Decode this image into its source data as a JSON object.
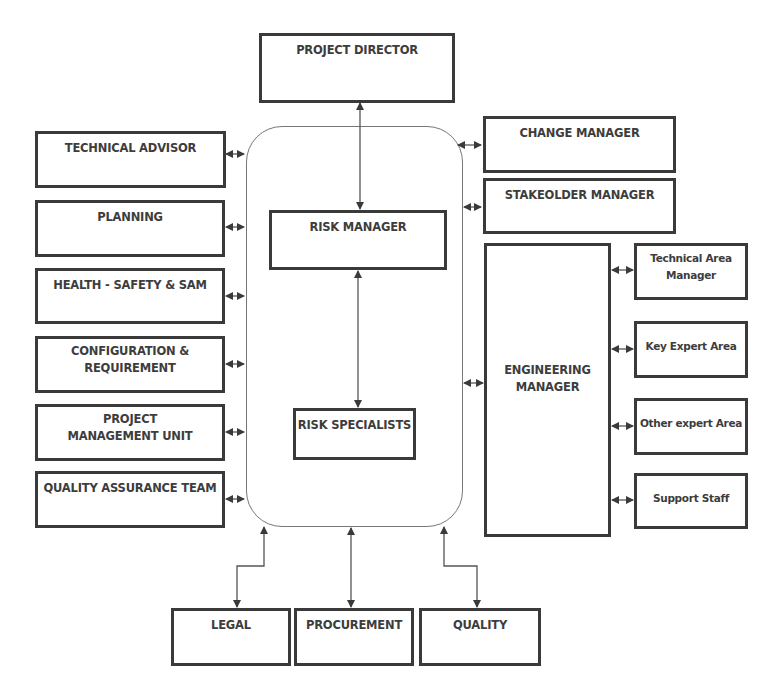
{
  "diagram": {
    "top": {
      "project_director": "PROJECT DIRECTOR"
    },
    "left": [
      {
        "label": "TECHNICAL ADVISOR"
      },
      {
        "label": "PLANNING"
      },
      {
        "label": "HEALTH - SAFETY & SAM"
      },
      {
        "label": "CONFIGURATION & REQUIREMENT"
      },
      {
        "label": "PROJECT MANAGEMENT UNIT"
      },
      {
        "label": "QUALITY ASSURANCE TEAM"
      }
    ],
    "center": {
      "risk_manager": "RISK MANAGER",
      "risk_specialists": "RISK SPECIALISTS"
    },
    "right": [
      {
        "label": "CHANGE MANAGER"
      },
      {
        "label": "STAKEOLDER MANAGER"
      },
      {
        "label": "ENGINEERING MANAGER"
      }
    ],
    "engineering_sub": [
      {
        "label": "Technical Area Manager"
      },
      {
        "label": "Key Expert Area"
      },
      {
        "label": "Other expert Area"
      },
      {
        "label": "Support Staff"
      }
    ],
    "bottom": [
      {
        "label": "LEGAL"
      },
      {
        "label": "PROCUREMENT"
      },
      {
        "label": "QUALITY"
      }
    ],
    "colors": {
      "box_border": "#3a3a3a",
      "text": "#3d3d3d",
      "group_border": "#777777"
    }
  }
}
